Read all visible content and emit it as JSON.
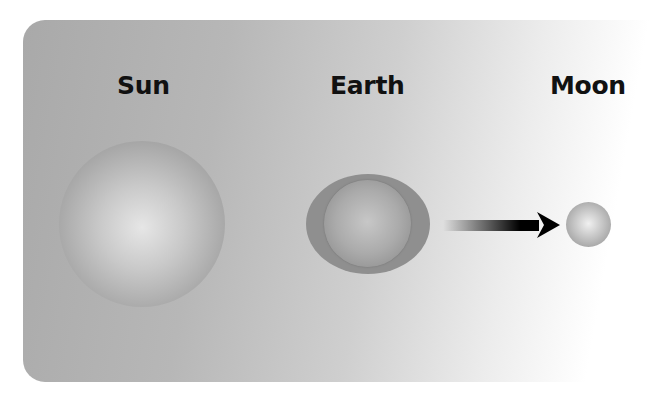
{
  "diagram": {
    "bodies": [
      {
        "id": "sun",
        "label": "Sun"
      },
      {
        "id": "earth",
        "label": "Earth"
      },
      {
        "id": "moon",
        "label": "Moon"
      }
    ],
    "arrow": {
      "from": "earth",
      "to": "moon",
      "direction": "right"
    },
    "colors": {
      "text": "#111111",
      "arrow": "#000000",
      "background_start": "#a9a9a9",
      "background_end": "#ffffff"
    }
  }
}
